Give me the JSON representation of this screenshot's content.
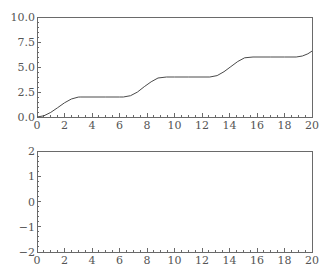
{
  "colors": {
    "background": "#ffffff",
    "frame": "#6a6a6a",
    "curve": "#4a4a4a",
    "tick_label": "#555555"
  },
  "chart_data": [
    {
      "type": "line",
      "title": "",
      "xlabel": "",
      "ylabel": "",
      "xlim": [
        0,
        20
      ],
      "ylim": [
        0,
        10
      ],
      "x_ticks": [
        0,
        2,
        4,
        6,
        8,
        10,
        12,
        14,
        16,
        18,
        20
      ],
      "x_tick_labels": [
        "0",
        "2",
        "4",
        "6",
        "8",
        "10",
        "12",
        "14",
        "16",
        "18",
        "20"
      ],
      "x_minor_step": 0.5,
      "y_ticks": [
        0,
        2.5,
        5,
        7.5,
        10
      ],
      "y_tick_labels": [
        "0.0",
        "2.5",
        "5.0",
        "7.5",
        "10.0"
      ],
      "y_minor_step": 0.5,
      "grid": false,
      "legend": null,
      "series": [
        {
          "name": "staircase",
          "x": [
            0,
            0.5,
            1,
            1.5,
            2,
            2.5,
            3,
            3.14,
            4,
            5,
            6,
            6.28,
            6.8,
            7.3,
            7.8,
            8.3,
            8.8,
            9.42,
            10,
            11,
            12,
            12.57,
            13.1,
            13.6,
            14.1,
            14.6,
            15.1,
            15.71,
            16,
            17,
            18,
            18.85,
            19.3,
            19.7,
            20
          ],
          "y": [
            0,
            0.12,
            0.46,
            0.93,
            1.42,
            1.8,
            1.99,
            2.0,
            2.0,
            2.0,
            2.0,
            2.0,
            2.13,
            2.49,
            3.03,
            3.52,
            3.9,
            4.0,
            4.0,
            4.0,
            4.0,
            4.0,
            4.14,
            4.53,
            5.04,
            5.55,
            5.92,
            6.0,
            6.0,
            6.0,
            6.0,
            6.0,
            6.1,
            6.32,
            6.59
          ]
        }
      ]
    },
    {
      "type": "line",
      "title": "",
      "xlabel": "",
      "ylabel": "",
      "xlim": [
        0,
        20
      ],
      "ylim": [
        -2,
        2
      ],
      "x_ticks": [
        0,
        2,
        4,
        6,
        8,
        10,
        12,
        14,
        16,
        18,
        20
      ],
      "x_tick_labels": [
        "0",
        "2",
        "4",
        "6",
        "8",
        "10",
        "12",
        "14",
        "16",
        "18",
        "20"
      ],
      "x_minor_step": 0.5,
      "y_ticks": [
        -2,
        -1,
        0,
        1,
        2
      ],
      "y_tick_labels": [
        "−2",
        "−1",
        "0",
        "1",
        "2"
      ],
      "y_minor_step": 0.2,
      "grid": false,
      "legend": null,
      "series": []
    }
  ]
}
